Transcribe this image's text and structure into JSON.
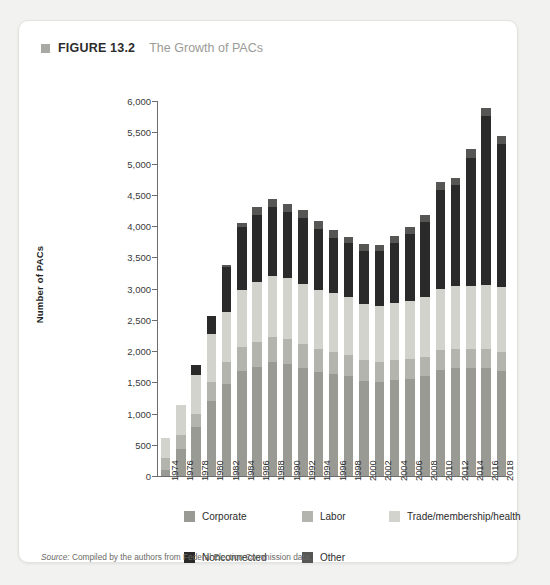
{
  "figure": {
    "marker_icon": "square-marker-icon",
    "label": "FIGURE 13.2",
    "title": "The Growth of PACs"
  },
  "source": {
    "prefix": "Source:",
    "text": " Compiled by the authors from Federal Election Commission data."
  },
  "colors": {
    "corporate": "#9a9a95",
    "labor": "#b4b4ae",
    "trade": "#d3d3cd",
    "nonconnected": "#2a2a2a",
    "other": "#565654",
    "axis": "#6d6d6d",
    "card_bg": "#ffffff",
    "page_bg": "#f2f2f0"
  },
  "legend": {
    "rows": [
      [
        {
          "label": "Corporate",
          "key": "corporate"
        },
        {
          "label": "Labor",
          "key": "labor"
        },
        {
          "label": "Trade/membership/health",
          "key": "trade"
        }
      ],
      [
        {
          "label": "Nonconnected",
          "key": "nonconnected"
        },
        {
          "label": "Other",
          "key": "other"
        }
      ]
    ]
  },
  "chart_data": {
    "type": "bar",
    "stacked": true,
    "title": "The Growth of PACs",
    "xlabel": "",
    "ylabel": "Number of PACs",
    "ylim": [
      0,
      6000
    ],
    "ytick_step": 500,
    "grid": false,
    "legend_position": "bottom",
    "ytick_labels": [
      "0",
      "500",
      "1,000",
      "1,500",
      "2,000",
      "2,500",
      "3,000",
      "3,500",
      "4,000",
      "4,500",
      "5,000",
      "5,500",
      "6,000"
    ],
    "categories": [
      "1974",
      "1976",
      "1978",
      "1980",
      "1982",
      "1984",
      "1986",
      "1988",
      "1990",
      "1992",
      "1994",
      "1996",
      "1998",
      "2000",
      "2002",
      "2004",
      "2006",
      "2008",
      "2010",
      "2012",
      "2014",
      "2016",
      "2018"
    ],
    "series": [
      {
        "name": "Corporate",
        "key": "corporate",
        "values": [
          90,
          430,
          780,
          1200,
          1470,
          1680,
          1740,
          1820,
          1795,
          1735,
          1660,
          1640,
          1600,
          1525,
          1500,
          1535,
          1560,
          1600,
          1700,
          1725,
          1730,
          1730,
          1680
        ]
      },
      {
        "name": "Labor",
        "key": "labor",
        "values": [
          200,
          230,
          220,
          300,
          350,
          380,
          400,
          400,
          390,
          380,
          370,
          350,
          340,
          330,
          320,
          320,
          310,
          310,
          310,
          310,
          310,
          310,
          310
        ]
      },
      {
        "name": "Trade/membership/health",
        "key": "trade",
        "values": [
          320,
          480,
          610,
          780,
          810,
          910,
          960,
          980,
          980,
          955,
          940,
          940,
          930,
          900,
          900,
          920,
          930,
          960,
          990,
          1000,
          1005,
          1010,
          1030
        ]
      },
      {
        "name": "Nonconnected",
        "key": "nonconnected",
        "values": [
          0,
          0,
          160,
          280,
          720,
          1020,
          1070,
          1100,
          1060,
          1055,
          980,
          880,
          860,
          850,
          880,
          960,
          1080,
          1200,
          1580,
          1620,
          2050,
          2710,
          2300
        ]
      },
      {
        "name": "Other",
        "key": "other",
        "values": [
          0,
          0,
          0,
          0,
          20,
          60,
          130,
          130,
          135,
          130,
          130,
          130,
          100,
          100,
          100,
          100,
          110,
          110,
          120,
          120,
          130,
          130,
          120
        ]
      }
    ],
    "totals": [
      610,
      1140,
      1770,
      2560,
      3370,
      4050,
      4300,
      4430,
      4360,
      4255,
      4080,
      3940,
      3830,
      3705,
      3700,
      3835,
      3990,
      4180,
      4700,
      4775,
      5225,
      5890,
      5440
    ]
  }
}
